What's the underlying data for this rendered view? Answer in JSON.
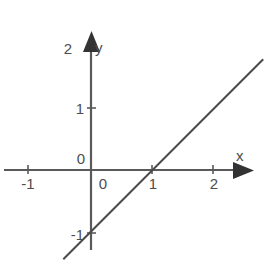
{
  "figure": {
    "title": "",
    "background_color": "#ffffff",
    "width": 267,
    "height": 264
  },
  "axes": {
    "x_axis": {
      "label": "x",
      "arrow": "arrow-right",
      "tick_labels": [
        "-1",
        "0",
        "1",
        "2"
      ],
      "tick_values": [
        -1,
        0,
        1,
        2
      ],
      "color": "#595959"
    },
    "y_axis": {
      "label": "y",
      "arrow": "arrow-up",
      "tick_labels": [
        "-1",
        "0",
        "1",
        "2"
      ],
      "tick_values": [
        -1,
        0,
        1,
        2
      ],
      "color": "#595959"
    },
    "origin_label": "0"
  },
  "chart_data": {
    "type": "line",
    "title": "",
    "xlabel": "x",
    "ylabel": "y",
    "xlim": [
      -1.4,
      2.9
    ],
    "ylim": [
      -1.35,
      2.2
    ],
    "xticks": [
      -1,
      0,
      1,
      2
    ],
    "yticks": [
      -1,
      0,
      1,
      2
    ],
    "xticklabels": [
      "-1",
      "0",
      "1",
      "2"
    ],
    "yticklabels": [
      "-1",
      "0",
      "1",
      "2"
    ],
    "grid": false,
    "legend": false,
    "series": [
      {
        "name": "y = x - 1",
        "equation": "y = x - 1",
        "slope": 1,
        "intercept": -1,
        "color": "#4a4a4a",
        "x": [
          -0.45,
          2.8
        ],
        "y": [
          -1.45,
          1.8
        ],
        "key_points": [
          {
            "label": "y-intercept",
            "x": 0,
            "y": -1
          },
          {
            "label": "x-intercept",
            "x": 1,
            "y": 0
          }
        ]
      }
    ]
  }
}
